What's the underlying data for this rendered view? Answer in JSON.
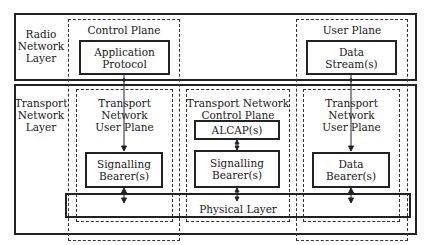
{
  "layers": {
    "radio": {
      "label": "Radio\nNetwork\nLayer"
    },
    "transport": {
      "label": "Transport\nNetwork\nLayer"
    }
  },
  "planes": {
    "control": {
      "label": "Control Plane"
    },
    "user": {
      "label": "User Plane"
    }
  },
  "radio_boxes": {
    "application_protocol": "Application\nProtocol",
    "data_streams": "Data\nStream(s)"
  },
  "transport_planes": {
    "tn_user_left": {
      "label": "Transport Network\nUser Plane"
    },
    "tn_control": {
      "label": "Transport Network\nControl Plane"
    },
    "tn_user_right": {
      "label": "Transport Network\nUser Plane"
    }
  },
  "transport_boxes": {
    "alcap": "ALCAP(s)",
    "signalling_bearer_left": "Signalling\nBearer(s)",
    "signalling_bearer_mid": "Signalling\nBearer(s)",
    "data_bearer": "Data\nBearer(s)"
  },
  "physical_layer": {
    "label": "Physical Layer"
  }
}
